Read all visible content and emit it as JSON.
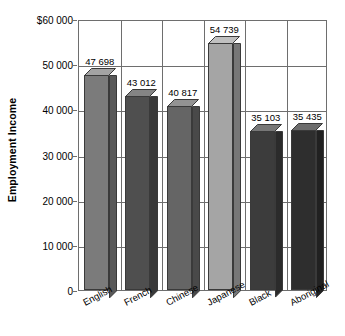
{
  "chart_data": {
    "type": "bar",
    "title": "",
    "subtitle": "",
    "xlabel": "",
    "ylabel": "Employment Income",
    "categories": [
      "English",
      "French",
      "Chinese",
      "Japanese",
      "Black",
      "Aboriginal"
    ],
    "values": [
      47698,
      43012,
      40817,
      54739,
      35103,
      35435
    ],
    "value_labels": [
      "47 698",
      "43 012",
      "40 817",
      "54 739",
      "35 103",
      "35 435"
    ],
    "bar_colors": [
      "#7b7b7b",
      "#4f4f4f",
      "#656565",
      "#a5a5a5",
      "#3c3c3c",
      "#2e2e2e"
    ],
    "ylim": [
      0,
      60000
    ],
    "ytick_values": [
      60000,
      50000,
      40000,
      30000,
      20000,
      10000,
      0
    ],
    "ytick_labels": [
      "$60 000",
      "50 000",
      "40 000",
      "30 000",
      "20 000",
      "10 000",
      "0"
    ],
    "grid": "horizontal-and-vertical",
    "legend": "none",
    "axis_color": "#6e6e6e"
  }
}
